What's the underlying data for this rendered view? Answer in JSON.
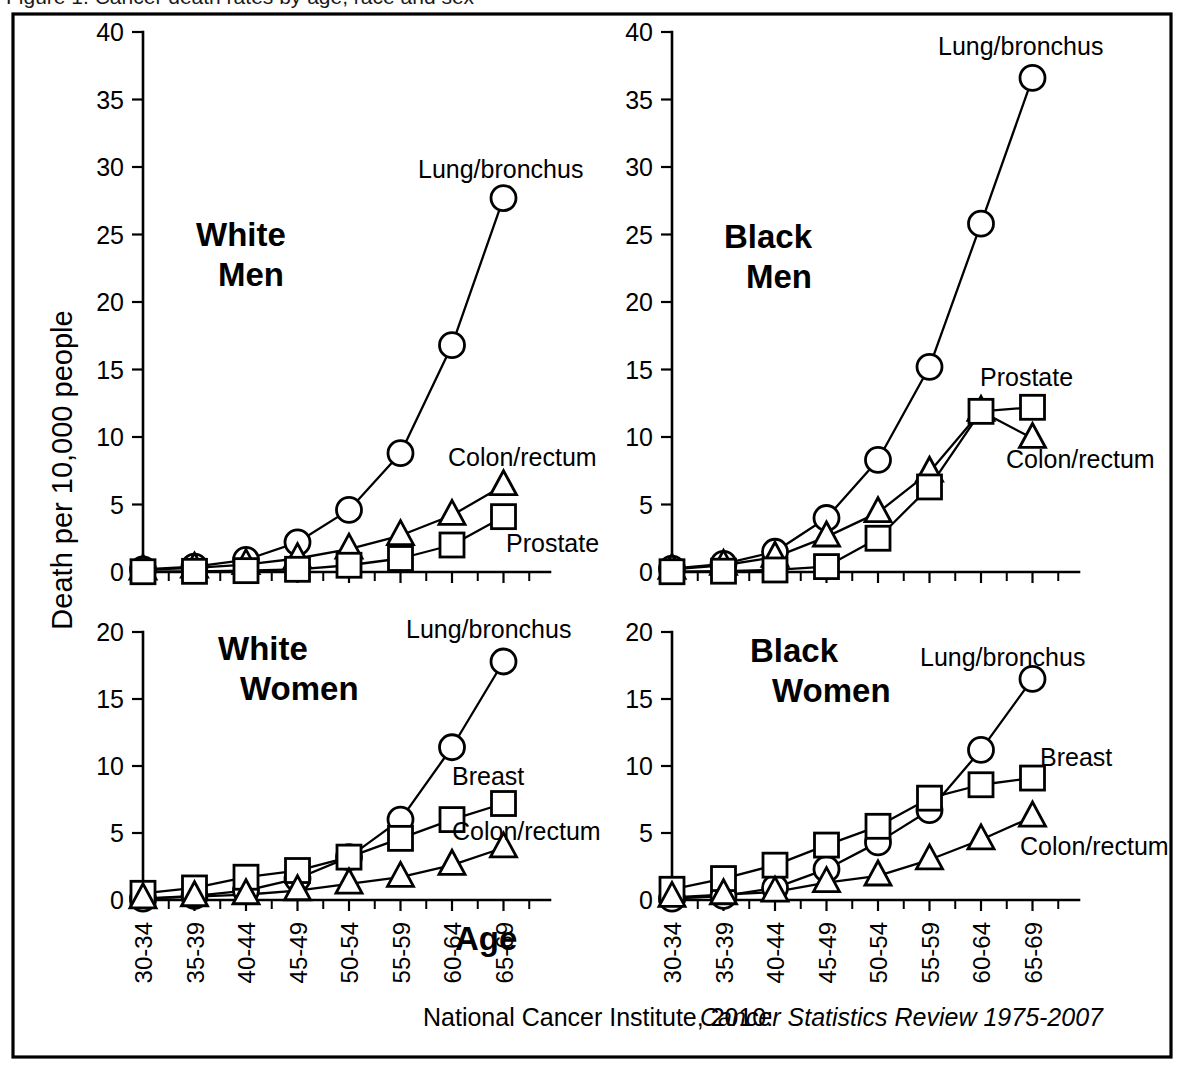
{
  "figure": {
    "frame_color": "#000000",
    "background": "#ffffff",
    "y_axis_title": "Death per 10,000 people",
    "x_axis_title": "Age",
    "source_prefix": "National Cancer Institute, 2010:",
    "source_italic": "Cancer Statistics Review 1975-2007",
    "top_caption_partial": "Figure 1. Cancer death rates by age, race and sex"
  },
  "chart_data": [
    {
      "type": "line",
      "title": "White Men",
      "xlabel": "Age",
      "ylabel": "Death per 10,000 people",
      "ylim": [
        0,
        40
      ],
      "yticks": [
        0,
        5,
        10,
        15,
        20,
        25,
        30,
        35,
        40
      ],
      "grid": false,
      "legend": "inline-annotations",
      "categories": [
        "30-34",
        "35-39",
        "40-44",
        "45-49",
        "50-54",
        "55-59",
        "60-64",
        "65-69"
      ],
      "series": [
        {
          "name": "Lung/bronchus",
          "marker": "circle",
          "values": [
            0.2,
            0.4,
            0.9,
            2.2,
            4.6,
            8.8,
            16.8,
            27.7
          ]
        },
        {
          "name": "Colon/rectum",
          "marker": "triangle",
          "values": [
            0.15,
            0.3,
            0.55,
            1.0,
            1.7,
            2.7,
            4.2,
            6.4
          ]
        },
        {
          "name": "Prostate",
          "marker": "square",
          "values": [
            0.02,
            0.05,
            0.1,
            0.2,
            0.5,
            1.0,
            2.0,
            4.1
          ]
        }
      ]
    },
    {
      "type": "line",
      "title": "Black Men",
      "xlabel": "Age",
      "ylabel": "Death per 10,000 people",
      "ylim": [
        0,
        40
      ],
      "yticks": [
        0,
        5,
        10,
        15,
        20,
        25,
        30,
        35,
        40
      ],
      "grid": false,
      "legend": "inline-annotations",
      "categories": [
        "30-34",
        "35-39",
        "40-44",
        "45-49",
        "50-54",
        "55-59",
        "60-64",
        "65-69"
      ],
      "series": [
        {
          "name": "Lung/bronchus",
          "marker": "circle",
          "values": [
            0.25,
            0.6,
            1.5,
            4.0,
            8.3,
            15.2,
            25.8,
            36.6
          ]
        },
        {
          "name": "Colon/rectum",
          "marker": "triangle",
          "values": [
            0.2,
            0.5,
            1.1,
            2.6,
            4.4,
            7.4,
            11.9,
            9.9
          ]
        },
        {
          "name": "Prostate",
          "marker": "square",
          "values": [
            0.02,
            0.06,
            0.15,
            0.4,
            2.5,
            6.3,
            11.9,
            12.2
          ]
        }
      ]
    },
    {
      "type": "line",
      "title": "White Women",
      "xlabel": "Age",
      "ylabel": "Death per 10,000 people",
      "ylim": [
        0,
        20
      ],
      "yticks": [
        0,
        5,
        10,
        15,
        20
      ],
      "grid": false,
      "legend": "inline-annotations",
      "categories": [
        "30-34",
        "35-39",
        "40-44",
        "45-49",
        "50-54",
        "55-59",
        "60-64",
        "65-69"
      ],
      "series": [
        {
          "name": "Lung/bronchus",
          "marker": "circle",
          "values": [
            0.1,
            0.3,
            0.7,
            1.6,
            3.2,
            6.0,
            11.4,
            17.8
          ]
        },
        {
          "name": "Breast",
          "marker": "square",
          "values": [
            0.5,
            0.9,
            1.7,
            2.2,
            3.2,
            4.6,
            6.0,
            7.2
          ]
        },
        {
          "name": "Colon/rectum",
          "marker": "triangle",
          "values": [
            0.1,
            0.25,
            0.4,
            0.7,
            1.2,
            1.7,
            2.6,
            3.9
          ]
        }
      ]
    },
    {
      "type": "line",
      "title": "Black Women",
      "xlabel": "Age",
      "ylabel": "Death per 10,000 people",
      "ylim": [
        0,
        20
      ],
      "yticks": [
        0,
        5,
        10,
        15,
        20
      ],
      "grid": false,
      "legend": "inline-annotations",
      "categories": [
        "30-34",
        "35-39",
        "40-44",
        "45-49",
        "50-54",
        "55-59",
        "60-64",
        "65-69"
      ],
      "series": [
        {
          "name": "Lung/bronchus",
          "marker": "circle",
          "values": [
            0.1,
            0.3,
            0.9,
            2.3,
            4.3,
            6.7,
            11.2,
            16.5
          ]
        },
        {
          "name": "Breast",
          "marker": "square",
          "values": [
            0.8,
            1.6,
            2.6,
            4.1,
            5.5,
            7.6,
            8.6,
            9.1
          ]
        },
        {
          "name": "Colon/rectum",
          "marker": "triangle",
          "values": [
            0.2,
            0.4,
            0.6,
            1.3,
            1.8,
            3.0,
            4.5,
            6.2
          ]
        }
      ]
    }
  ],
  "panels": [
    {
      "id": "white-men",
      "title_line1": "White",
      "title_line2": "Men",
      "annotations": [
        {
          "text": "Lung/bronchus",
          "name": "lung-bronchus-label"
        },
        {
          "text": "Colon/rectum",
          "name": "colon-rectum-label"
        },
        {
          "text": "Prostate",
          "name": "prostate-label"
        }
      ],
      "ytick_labels": [
        "0",
        "5",
        "10",
        "15",
        "20",
        "25",
        "30",
        "35",
        "40"
      ]
    },
    {
      "id": "black-men",
      "title_line1": "Black",
      "title_line2": "Men",
      "annotations": [
        {
          "text": "Lung/bronchus",
          "name": "lung-bronchus-label"
        },
        {
          "text": "Prostate",
          "name": "prostate-label"
        },
        {
          "text": "Colon/rectum",
          "name": "colon-rectum-label"
        }
      ],
      "ytick_labels": [
        "0",
        "5",
        "10",
        "15",
        "20",
        "25",
        "30",
        "35",
        "40"
      ]
    },
    {
      "id": "white-women",
      "title_line1": "White",
      "title_line2": "Women",
      "annotations": [
        {
          "text": "Lung/bronchus",
          "name": "lung-bronchus-label"
        },
        {
          "text": "Breast",
          "name": "breast-label"
        },
        {
          "text": "Colon/rectum",
          "name": "colon-rectum-label"
        }
      ],
      "ytick_labels": [
        "0",
        "5",
        "10",
        "15",
        "20"
      ]
    },
    {
      "id": "black-women",
      "title_line1": "Black",
      "title_line2": "Women",
      "annotations": [
        {
          "text": "Lung/bronchus",
          "name": "lung-bronchus-label"
        },
        {
          "text": "Breast",
          "name": "breast-label"
        },
        {
          "text": "Colon/rectum",
          "name": "colon-rectum-label"
        }
      ],
      "ytick_labels": [
        "0",
        "5",
        "10",
        "15",
        "20"
      ]
    }
  ],
  "x_categories": [
    "30-34",
    "35-39",
    "40-44",
    "45-49",
    "50-54",
    "55-59",
    "60-64",
    "65-69"
  ]
}
